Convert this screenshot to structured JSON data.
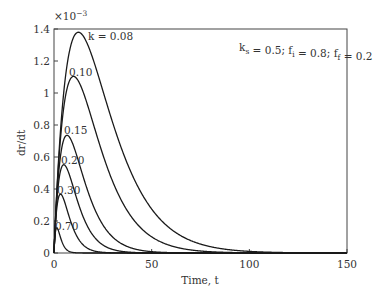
{
  "chart_data": {
    "type": "line",
    "title": "",
    "xlabel": "Time, t",
    "ylabel": "dr/dt",
    "y_multiplier_label": "×10",
    "y_multiplier_exponent": "−3",
    "xlim": [
      0,
      150
    ],
    "ylim": [
      0,
      1.4
    ],
    "x_ticks": [
      0,
      50,
      100,
      150
    ],
    "x_tick_labels": [
      "0",
      "50",
      "100",
      "150"
    ],
    "y_ticks": [
      0,
      0.2,
      0.4,
      0.6,
      0.8,
      1.0,
      1.2,
      1.4
    ],
    "y_tick_labels": [
      "0",
      "0.2",
      "0.4",
      "0.6",
      "0.8",
      "1",
      "1.2",
      "1.4"
    ],
    "grid": false,
    "legend": "none (inline curve labels)",
    "annotation": {
      "parts": [
        {
          "text": "k",
          "sub": "s"
        },
        {
          "text": " = 0.5; f",
          "sub": "i"
        },
        {
          "text": " = 0.8; f",
          "sub": "f"
        },
        {
          "text": " = 0.2",
          "sub": ""
        }
      ]
    },
    "model": "dr/dt = A · t · exp(−k t), values in units of 1e-3",
    "model_A": 0.3,
    "series": [
      {
        "name": "k = 0.08",
        "label": "k = 0.08",
        "k": 0.08,
        "peak_t": 12.5,
        "peak_value": 1.38,
        "label_pos": [
          88,
          40
        ]
      },
      {
        "name": "k = 0.10",
        "label": "0.10",
        "k": 0.1,
        "peak_t": 10.0,
        "peak_value": 1.1,
        "label_pos": [
          69,
          76
        ]
      },
      {
        "name": "k = 0.15",
        "label": "0.15",
        "k": 0.15,
        "peak_t": 6.7,
        "peak_value": 0.74,
        "label_pos": [
          64,
          134
        ]
      },
      {
        "name": "k = 0.20",
        "label": "0.20",
        "k": 0.2,
        "peak_t": 5.0,
        "peak_value": 0.55,
        "label_pos": [
          61,
          164
        ]
      },
      {
        "name": "k = 0.30",
        "label": "0.30",
        "k": 0.3,
        "peak_t": 3.3,
        "peak_value": 0.37,
        "label_pos": [
          57,
          194
        ]
      },
      {
        "name": "k = 0.70",
        "label": "0.70",
        "k": 0.7,
        "peak_t": 1.4,
        "peak_value": 0.16,
        "label_pos": [
          55,
          230
        ]
      }
    ]
  }
}
